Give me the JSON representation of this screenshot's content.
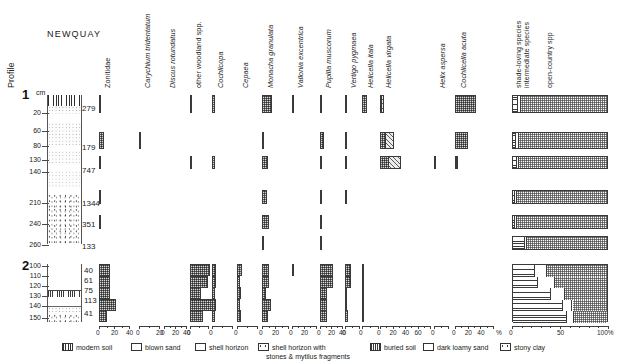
{
  "figure": {
    "site_title": "NEWQUAY",
    "profile_axis_label": "Profile",
    "depth_unit": "cm",
    "percent_symbol": "%",
    "percent_100": "100%"
  },
  "profiles": [
    {
      "id": "1",
      "label": "1",
      "depth_ticks": [
        "20",
        "60",
        "80",
        "130",
        "140",
        "210",
        "240",
        "260"
      ],
      "samples": [
        {
          "depth": "20",
          "count": "279"
        },
        {
          "depth": "80",
          "count": "179"
        },
        {
          "depth": "140",
          "count": "747"
        },
        {
          "depth": "210",
          "count": "1344"
        },
        {
          "depth": "240",
          "count": "351"
        },
        {
          "depth": "260",
          "count": "133"
        }
      ]
    },
    {
      "id": "2",
      "label": "2",
      "depth_ticks": [
        "100",
        "110",
        "120",
        "130",
        "140",
        "150"
      ],
      "samples": [
        {
          "depth": "100",
          "count": "40"
        },
        {
          "depth": "110",
          "count": "61"
        },
        {
          "depth": "120",
          "count": "75"
        },
        {
          "depth": "130",
          "count": "113"
        },
        {
          "depth": "150",
          "count": "41"
        }
      ]
    }
  ],
  "taxa": [
    {
      "name": "Zonitidae",
      "italic": false,
      "axis_max": 40,
      "ticks": [
        0,
        20,
        40
      ]
    },
    {
      "name": "Carychium tridentatum",
      "italic": true,
      "axis_max": 20,
      "ticks": [
        0,
        20
      ]
    },
    {
      "name": "Discus rotundatus",
      "italic": true,
      "axis_max": 40,
      "ticks": [
        0,
        20,
        40
      ]
    },
    {
      "name": "other woodland spp.",
      "italic": false,
      "axis_max": 20,
      "ticks": [
        0
      ]
    },
    {
      "name": "Cochlicopa",
      "italic": true,
      "axis_max": 20,
      "ticks": [
        0
      ]
    },
    {
      "name": "Cepaea",
      "italic": true,
      "axis_max": 20,
      "ticks": [
        0
      ]
    },
    {
      "name": "Monacha granulata",
      "italic": true,
      "axis_max": 40,
      "ticks": [
        0,
        20
      ]
    },
    {
      "name": "Vallonia excentrica",
      "italic": true,
      "axis_max": 40,
      "ticks": [
        0,
        20
      ]
    },
    {
      "name": "Pupilla muscorum",
      "italic": true,
      "axis_max": 40,
      "ticks": [
        0,
        20,
        40
      ]
    },
    {
      "name": "Vertigo pygmaea",
      "italic": true,
      "axis_max": 20,
      "ticks": [
        0
      ]
    },
    {
      "name": "Helicella itala",
      "italic": true,
      "axis_max": 20,
      "ticks": [
        0
      ]
    },
    {
      "name": "Helicella virgata",
      "italic": true,
      "axis_max": 80,
      "ticks": [
        0,
        20,
        40,
        60
      ]
    },
    {
      "name": "Helix aspersa",
      "italic": true,
      "axis_max": 20,
      "ticks": [
        0
      ]
    },
    {
      "name": "Cochlicella acuta",
      "italic": true,
      "axis_max": 60,
      "ticks": [
        0,
        20,
        40
      ]
    }
  ],
  "summary_columns": [
    {
      "name": "shade-loving species"
    },
    {
      "name": "intermediate species"
    },
    {
      "name": "open-country spp"
    }
  ],
  "summary_axis": {
    "ticks": [
      "0",
      "50",
      "100%"
    ]
  },
  "legend": [
    {
      "key": "modern-soil",
      "label": "modern soil"
    },
    {
      "key": "blown-sand",
      "label": "blown sand"
    },
    {
      "key": "shell-horizon",
      "label": "shell horizon"
    },
    {
      "key": "shell-horizon-stones",
      "label": "shell horizon with",
      "label2": "stones & mytilus fragments"
    },
    {
      "key": "buried-soil",
      "label": "buried soil"
    },
    {
      "key": "dark-loamy-sand",
      "label": "dark loamy sand"
    },
    {
      "key": "stony-clay",
      "label": "stony clay"
    }
  ],
  "lithology": {
    "profile1": [
      {
        "type": "modern soil",
        "from": 0,
        "to": 22
      },
      {
        "type": "blown sand",
        "from": 22,
        "to": 230
      },
      {
        "type": "stony clay",
        "from": 230,
        "to": 268
      }
    ],
    "profile2": [
      {
        "type": "blown sand",
        "from": 95,
        "to": 127
      },
      {
        "type": "buried soil",
        "from": 127,
        "to": 134
      },
      {
        "type": "dark loamy sand",
        "from": 134,
        "to": 144
      },
      {
        "type": "shell horizon",
        "from": 144,
        "to": 150
      },
      {
        "type": "stony clay",
        "from": 150,
        "to": 156
      }
    ]
  },
  "chart_data": {
    "type": "bar",
    "title": "NEWQUAY",
    "xlabel": "%",
    "ylabel": "Depth (cm)",
    "grid": false,
    "legend_position": "bottom",
    "profile1_depths": [
      20,
      80,
      140,
      210,
      240,
      260
    ],
    "profile1_counts": [
      279,
      179,
      747,
      1344,
      351,
      133
    ],
    "profile2_depths": [
      100,
      110,
      120,
      130,
      150
    ],
    "profile2_counts": [
      40,
      61,
      75,
      113,
      41
    ],
    "series": [
      {
        "name": "Zonitidae",
        "profile1": [
          2,
          6,
          1,
          1,
          1,
          0
        ],
        "profile2": [
          14,
          14,
          14,
          22,
          10
        ]
      },
      {
        "name": "Carychium tridentatum",
        "profile1": [
          0,
          2,
          0,
          0,
          0,
          0
        ],
        "profile2": [
          0,
          0,
          0,
          0,
          0
        ]
      },
      {
        "name": "Discus rotundatus",
        "profile1": [
          0,
          0,
          0,
          0,
          0,
          0
        ],
        "profile2": [
          0,
          0,
          0,
          0,
          0
        ]
      },
      {
        "name": "other woodland spp.",
        "profile1": [
          2,
          0,
          1,
          0,
          0,
          0
        ],
        "profile2": [
          22,
          20,
          12,
          26,
          14
        ]
      },
      {
        "name": "Cochlicopa",
        "profile1": [
          3,
          0,
          3,
          0,
          0,
          0
        ],
        "profile2": [
          4,
          4,
          3,
          4,
          3
        ]
      },
      {
        "name": "Cepaea",
        "profile1": [
          0,
          0,
          0,
          0,
          0,
          0
        ],
        "profile2": [
          5,
          3,
          4,
          3,
          4
        ]
      },
      {
        "name": "Monacha granulata",
        "profile1": [
          16,
          3,
          9,
          8,
          10,
          3
        ],
        "profile2": [
          11,
          11,
          6,
          14,
          9
        ]
      },
      {
        "name": "Vallonia excentrica",
        "profile1": [
          1,
          0,
          0,
          0,
          0,
          0
        ],
        "profile2": [
          2,
          0,
          0,
          0,
          0
        ]
      },
      {
        "name": "Pupilla muscorum",
        "profile1": [
          3,
          8,
          4,
          1,
          1,
          2
        ],
        "profile2": [
          23,
          23,
          13,
          12,
          12
        ]
      },
      {
        "name": "Vertigo pygmaea",
        "profile1": [
          3,
          1,
          1,
          1,
          0,
          0
        ],
        "profile2": [
          8,
          8,
          3,
          3,
          4
        ]
      },
      {
        "name": "Helicella itala",
        "profile1": [
          6,
          0,
          0,
          0,
          0,
          0
        ],
        "profile2": [
          2,
          2,
          3,
          2,
          1
        ]
      },
      {
        "name": "Helicella virgata",
        "profile1": [
          7,
          22,
          33,
          0,
          0,
          0
        ],
        "profile2": [
          0,
          0,
          0,
          0,
          0
        ]
      },
      {
        "name": "Helix aspersa",
        "profile1": [
          0,
          0,
          2,
          0,
          0,
          0
        ],
        "profile2": [
          0,
          0,
          0,
          0,
          0
        ]
      },
      {
        "name": "Cochlicella acuta",
        "profile1": [
          33,
          20,
          4,
          0,
          0,
          0
        ],
        "profile2": [
          0,
          0,
          0,
          0,
          0
        ]
      }
    ],
    "summary": {
      "categories": [
        "shade-loving species",
        "intermediate species",
        "open-country spp"
      ],
      "profile1": [
        {
          "depth": 20,
          "shade": 5,
          "intermediate": 3,
          "open": 92
        },
        {
          "depth": 80,
          "shade": 3,
          "intermediate": 3,
          "open": 94
        },
        {
          "depth": 140,
          "shade": 4,
          "intermediate": 2,
          "open": 94
        },
        {
          "depth": 210,
          "shade": 2,
          "intermediate": 2,
          "open": 96
        },
        {
          "depth": 240,
          "shade": 2,
          "intermediate": 2,
          "open": 96
        },
        {
          "depth": 260,
          "shade": 12,
          "intermediate": 3,
          "open": 85
        }
      ],
      "profile2": [
        {
          "depth": 100,
          "shade": 23,
          "intermediate": 12,
          "open": 65
        },
        {
          "depth": 110,
          "shade": 26,
          "intermediate": 18,
          "open": 56
        },
        {
          "depth": 120,
          "shade": 40,
          "intermediate": 14,
          "open": 46
        },
        {
          "depth": 130,
          "shade": 52,
          "intermediate": 10,
          "open": 38
        },
        {
          "depth": 150,
          "shade": 56,
          "intermediate": 8,
          "open": 36
        }
      ]
    }
  }
}
